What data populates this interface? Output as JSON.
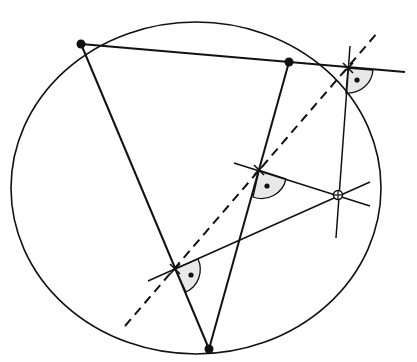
{
  "diagram": {
    "type": "geometry",
    "colors": {
      "stroke": "#111111",
      "angle_fill": "#e6e6e6",
      "background": "#ffffff"
    },
    "circumcircle": {
      "cx": 195,
      "cy": 188,
      "rx": 185,
      "ry": 166
    },
    "vertices": [
      {
        "id": "A",
        "x": 81,
        "y": 44
      },
      {
        "id": "B",
        "x": 289,
        "y": 62
      },
      {
        "id": "C",
        "x": 209,
        "y": 349
      }
    ],
    "point_on_circle": {
      "id": "P",
      "x": 338,
      "y": 195
    },
    "feet": [
      {
        "id": "F_AB",
        "x": 348,
        "y": 68
      },
      {
        "id": "F_BC",
        "x": 259,
        "y": 170
      },
      {
        "id": "F_CA",
        "x": 175,
        "y": 269
      }
    ],
    "simson_line": {
      "x1": 125,
      "y1": 326,
      "x2": 378,
      "y2": 32,
      "style": "dashed"
    },
    "right_angle_markers": 3
  }
}
